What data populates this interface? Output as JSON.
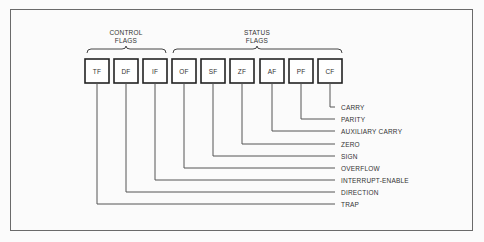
{
  "diagram": {
    "groups": [
      {
        "name": "control",
        "line1": "CONTROL",
        "line2": "FLAGS"
      },
      {
        "name": "status",
        "line1": "STATUS",
        "line2": "FLAGS"
      }
    ],
    "flags": [
      {
        "abbr": "TF",
        "label": "TRAP"
      },
      {
        "abbr": "DF",
        "label": "DIRECTION"
      },
      {
        "abbr": "IF",
        "label": "INTERRUPT-ENABLE"
      },
      {
        "abbr": "OF",
        "label": "OVERFLOW"
      },
      {
        "abbr": "SF",
        "label": "SIGN"
      },
      {
        "abbr": "ZF",
        "label": "ZERO"
      },
      {
        "abbr": "AF",
        "label": "AUXILIARY CARRY"
      },
      {
        "abbr": "PF",
        "label": "PARITY"
      },
      {
        "abbr": "CF",
        "label": "CARRY"
      }
    ]
  }
}
